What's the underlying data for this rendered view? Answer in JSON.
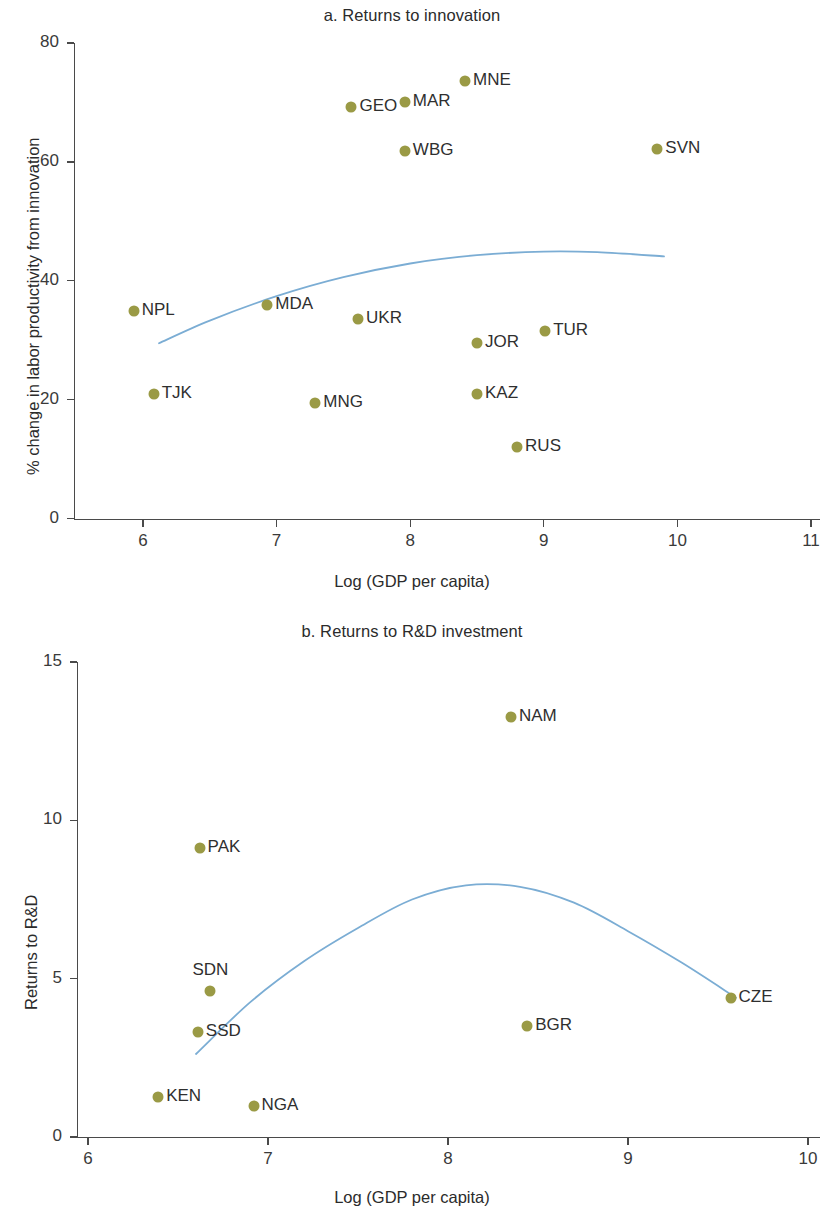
{
  "figure": {
    "axis_x_title": "Log (GDP per capita)",
    "marker_color": "#9a9a45",
    "trendline_color": "#7badd4",
    "axis_color": "#4a4a4a"
  },
  "panel_a": {
    "title": "a. Returns to innovation",
    "axis_y_title": "% change in labor productivity from innovation",
    "axis_x_title": "Log (GDP per capita)",
    "y_ticks": [
      "0",
      "20",
      "40",
      "60",
      "80"
    ],
    "x_ticks": [
      "6",
      "7",
      "8",
      "9",
      "10",
      "11"
    ]
  },
  "panel_b": {
    "title": "b. Returns to R&D investment",
    "axis_y_title": "Returns to R&D",
    "axis_x_title": "Log (GDP per capita)",
    "y_ticks": [
      "0",
      "5",
      "10",
      "15"
    ],
    "x_ticks": [
      "6",
      "7",
      "8",
      "9",
      "10"
    ]
  },
  "chart_data": [
    {
      "type": "scatter",
      "id": "panel_a",
      "title": "a. Returns to innovation",
      "xlabel": "Log (GDP per capita)",
      "ylabel": "% change in labor productivity from innovation",
      "xlim": [
        5.55,
        11.1
      ],
      "ylim": [
        0,
        84
      ],
      "xticks": [
        6,
        7,
        8,
        9,
        10,
        11
      ],
      "yticks": [
        0,
        20,
        40,
        60,
        80
      ],
      "grid": false,
      "legend": "none",
      "marker_color": "#9a9a45",
      "points": [
        {
          "label": "NPL",
          "x": 5.93,
          "y": 34.9,
          "label_pos": "right"
        },
        {
          "label": "TJK",
          "x": 6.08,
          "y": 20.9,
          "label_pos": "right"
        },
        {
          "label": "MDA",
          "x": 6.93,
          "y": 35.9,
          "label_pos": "right"
        },
        {
          "label": "MNG",
          "x": 7.29,
          "y": 19.4,
          "label_pos": "right"
        },
        {
          "label": "GEO",
          "x": 7.56,
          "y": 69.2,
          "label_pos": "right"
        },
        {
          "label": "UKR",
          "x": 7.61,
          "y": 33.5,
          "label_pos": "right"
        },
        {
          "label": "MAR",
          "x": 7.96,
          "y": 70.0,
          "label_pos": "right"
        },
        {
          "label": "WBG",
          "x": 7.96,
          "y": 61.8,
          "label_pos": "right"
        },
        {
          "label": "MNE",
          "x": 8.41,
          "y": 73.6,
          "label_pos": "right"
        },
        {
          "label": "JOR",
          "x": 8.5,
          "y": 29.6,
          "label_pos": "right"
        },
        {
          "label": "KAZ",
          "x": 8.5,
          "y": 20.9,
          "label_pos": "right"
        },
        {
          "label": "RUS",
          "x": 8.8,
          "y": 12.0,
          "label_pos": "right"
        },
        {
          "label": "TUR",
          "x": 9.01,
          "y": 31.5,
          "label_pos": "right"
        },
        {
          "label": "SVN",
          "x": 9.85,
          "y": 62.1,
          "label_pos": "right"
        }
      ],
      "trendline": {
        "color": "#7badd4",
        "type": "quadratic-fit",
        "x_range": [
          6.12,
          9.9
        ],
        "points": [
          {
            "x": 6.12,
            "y": 29.5
          },
          {
            "x": 6.5,
            "y": 33.3
          },
          {
            "x": 7.0,
            "y": 37.4
          },
          {
            "x": 7.5,
            "y": 40.6
          },
          {
            "x": 8.0,
            "y": 42.9
          },
          {
            "x": 8.5,
            "y": 44.3
          },
          {
            "x": 9.0,
            "y": 44.9
          },
          {
            "x": 9.4,
            "y": 44.8
          },
          {
            "x": 9.9,
            "y": 44.1
          }
        ]
      }
    },
    {
      "type": "scatter",
      "id": "panel_b",
      "title": "b. Returns to R&D investment",
      "xlabel": "Log (GDP per capita)",
      "ylabel": "Returns to R&D",
      "xlim": [
        5.88,
        10.08
      ],
      "ylim": [
        0,
        16.1
      ],
      "xticks": [
        6,
        7,
        8,
        9,
        10
      ],
      "yticks": [
        0,
        5,
        10,
        15
      ],
      "grid": false,
      "legend": "none",
      "marker_color": "#9a9a45",
      "points": [
        {
          "label": "KEN",
          "x": 6.39,
          "y": 1.26,
          "label_pos": "right"
        },
        {
          "label": "SSD",
          "x": 6.61,
          "y": 3.32,
          "label_pos": "right"
        },
        {
          "label": "PAK",
          "x": 6.62,
          "y": 9.12,
          "label_pos": "right"
        },
        {
          "label": "SDN",
          "x": 6.68,
          "y": 4.61,
          "label_pos": "above"
        },
        {
          "label": "NGA",
          "x": 6.92,
          "y": 0.98,
          "label_pos": "right"
        },
        {
          "label": "NAM",
          "x": 8.35,
          "y": 13.25,
          "label_pos": "right"
        },
        {
          "label": "BGR",
          "x": 8.44,
          "y": 3.5,
          "label_pos": "right"
        },
        {
          "label": "CZE",
          "x": 9.57,
          "y": 4.38,
          "label_pos": "right"
        }
      ],
      "trendline": {
        "color": "#7badd4",
        "type": "quadratic-fit",
        "x_range": [
          6.6,
          9.6
        ],
        "points": [
          {
            "x": 6.6,
            "y": 2.62
          },
          {
            "x": 6.9,
            "y": 4.25
          },
          {
            "x": 7.2,
            "y": 5.55
          },
          {
            "x": 7.5,
            "y": 6.6
          },
          {
            "x": 7.8,
            "y": 7.5
          },
          {
            "x": 8.1,
            "y": 7.95
          },
          {
            "x": 8.4,
            "y": 7.9
          },
          {
            "x": 8.7,
            "y": 7.4
          },
          {
            "x": 9.0,
            "y": 6.5
          },
          {
            "x": 9.3,
            "y": 5.5
          },
          {
            "x": 9.6,
            "y": 4.4
          }
        ]
      }
    }
  ]
}
